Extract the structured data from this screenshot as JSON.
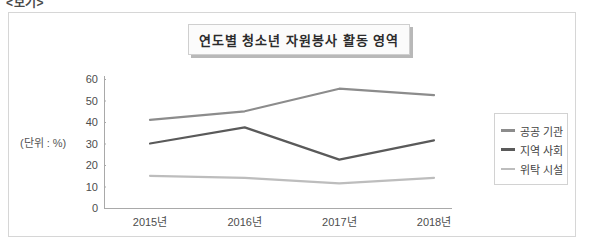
{
  "top_caption": "<보기>",
  "figure": {
    "unit_label": "(단위 : %)"
  },
  "chart_data": {
    "type": "line",
    "title": "연도별 청소년 자원봉사 활동 영역",
    "xlabel": "",
    "ylabel": "",
    "unit": "(단위 : %)",
    "categories": [
      "2015년",
      "2016년",
      "2017년",
      "2018년"
    ],
    "ylim": [
      0,
      60
    ],
    "yticks": [
      0,
      10,
      20,
      30,
      40,
      50,
      60
    ],
    "ytick_labels": [
      "0",
      "10",
      "20",
      "30",
      "40",
      "50",
      "60"
    ],
    "grid": false,
    "legend_position": "right",
    "series": [
      {
        "name": "공공 기관",
        "values": [
          41,
          45,
          55.5,
          52.5
        ],
        "color": "#8c8c8c"
      },
      {
        "name": "지역 사회",
        "values": [
          30,
          37.5,
          22.5,
          31.5
        ],
        "color": "#5a5a5a"
      },
      {
        "name": "위탁 시설",
        "values": [
          15,
          14,
          11.5,
          14
        ],
        "color": "#bdbdbd"
      }
    ]
  }
}
